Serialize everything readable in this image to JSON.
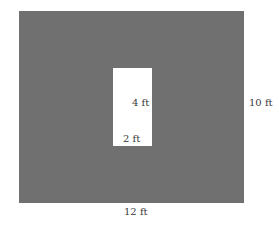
{
  "diagram": {
    "outer_rect": {
      "width_label": "12 ft",
      "height_label": "10 ft",
      "fill": "#707070"
    },
    "inner_rect": {
      "width_label": "2 ft",
      "height_label": "4 ft",
      "fill": "#ffffff"
    }
  }
}
